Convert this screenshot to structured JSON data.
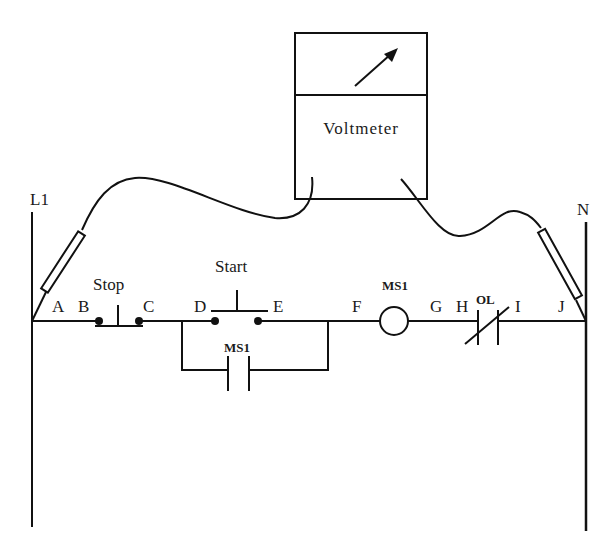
{
  "diagram": {
    "type": "ladder-logic-motor-control-with-voltmeter",
    "rails": {
      "left": "L1",
      "right": "N"
    },
    "voltmeter": {
      "label": "Voltmeter"
    },
    "components": {
      "stop": {
        "label": "Stop",
        "type": "normally-closed-pushbutton"
      },
      "start": {
        "label": "Start",
        "type": "normally-open-pushbutton"
      },
      "seal_in": {
        "label": "MS1",
        "type": "normally-open-contact"
      },
      "coil": {
        "label": "MS1",
        "type": "coil"
      },
      "overload": {
        "label": "OL",
        "type": "normally-closed-contact"
      }
    },
    "points": {
      "A": "A",
      "B": "B",
      "C": "C",
      "D": "D",
      "E": "E",
      "F": "F",
      "G": "G",
      "H": "H",
      "I": "I",
      "J": "J"
    }
  }
}
